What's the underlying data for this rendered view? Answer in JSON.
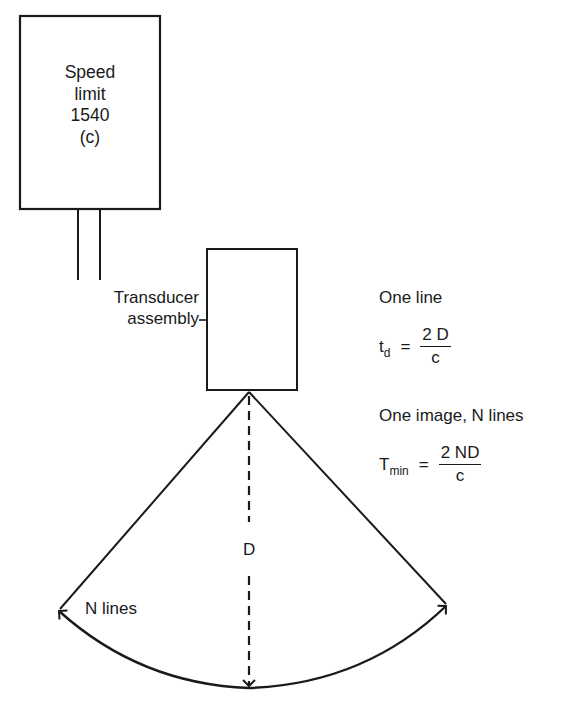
{
  "sign": {
    "lines": [
      "Speed",
      "limit",
      "1540",
      "(c)"
    ]
  },
  "transducer": {
    "label_line1": "Transducer",
    "label_line2": "assembly"
  },
  "one_line": {
    "heading": "One line",
    "lhs_base": "t",
    "lhs_sub": "d",
    "equals": "=",
    "numerator": "2 D",
    "denominator": "c"
  },
  "one_image": {
    "heading": "One image, N lines",
    "lhs_base": "T",
    "lhs_sub": "min",
    "equals": "=",
    "numerator": "2 ND",
    "denominator": "c"
  },
  "scan": {
    "depth_label": "D",
    "lines_label": "N lines"
  },
  "colors": {
    "ink": "#1a1a1a",
    "background": "#ffffff"
  }
}
